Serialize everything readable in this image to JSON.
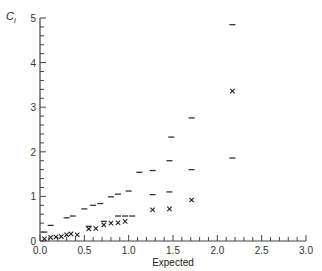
{
  "chart_data": {
    "type": "scatter",
    "title": "",
    "xlabel": "Expected",
    "ylabel": "C_i",
    "ylabel_main": "C",
    "ylabel_sub": "i",
    "xlim": [
      0,
      3.0
    ],
    "ylim": [
      0,
      5
    ],
    "grid": false,
    "legend": null,
    "x_ticks": [
      "0.0",
      "0.5",
      "1.0",
      "1.5",
      "2.0",
      "2.5",
      "3.0"
    ],
    "y_ticks": [
      "0",
      "1",
      "2",
      "3",
      "4",
      "5"
    ],
    "series": [
      {
        "name": "observed",
        "marker": "x",
        "points": [
          [
            0.05,
            0.05
          ],
          [
            0.12,
            0.08
          ],
          [
            0.18,
            0.09
          ],
          [
            0.24,
            0.1
          ],
          [
            0.3,
            0.14
          ],
          [
            0.35,
            0.16
          ],
          [
            0.42,
            0.14
          ],
          [
            0.55,
            0.27
          ],
          [
            0.63,
            0.28
          ],
          [
            0.72,
            0.36
          ],
          [
            0.8,
            0.4
          ],
          [
            0.88,
            0.41
          ],
          [
            0.96,
            0.44
          ],
          [
            1.27,
            0.7
          ],
          [
            1.46,
            0.72
          ],
          [
            1.71,
            0.92
          ],
          [
            2.17,
            3.36
          ]
        ]
      },
      {
        "name": "upper_bound",
        "marker": "dash",
        "points": [
          [
            0.05,
            0.2
          ],
          [
            0.12,
            0.35
          ],
          [
            0.3,
            0.52
          ],
          [
            0.37,
            0.56
          ],
          [
            0.5,
            0.72
          ],
          [
            0.6,
            0.8
          ],
          [
            0.68,
            0.84
          ],
          [
            0.8,
            0.99
          ],
          [
            0.88,
            1.05
          ],
          [
            1.0,
            1.12
          ],
          [
            1.12,
            1.54
          ],
          [
            1.27,
            1.58
          ],
          [
            1.46,
            1.8
          ],
          [
            1.48,
            2.33
          ],
          [
            1.71,
            2.76
          ],
          [
            2.17,
            4.85
          ]
        ]
      },
      {
        "name": "lower_bound",
        "marker": "dash",
        "points": [
          [
            0.55,
            0.33
          ],
          [
            0.72,
            0.44
          ],
          [
            0.88,
            0.56
          ],
          [
            0.96,
            0.56
          ],
          [
            1.04,
            0.56
          ],
          [
            1.27,
            1.04
          ],
          [
            1.46,
            1.1
          ],
          [
            1.71,
            1.6
          ],
          [
            2.17,
            1.86
          ]
        ]
      }
    ]
  }
}
